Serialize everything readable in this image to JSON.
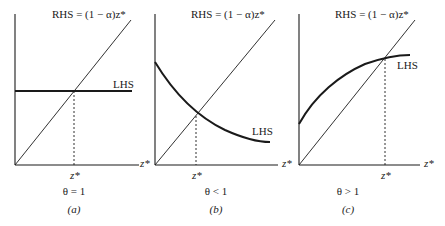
{
  "figure": {
    "panels": [
      {
        "id": "a",
        "caption": "(a)",
        "condition": "θ = 1",
        "rhs_label": "RHS = (1 − α)z*",
        "lhs_label": "LHS",
        "x_axis_label": "z*",
        "equilibrium_label": "z*",
        "lhs_shape": "horizontal"
      },
      {
        "id": "b",
        "caption": "(b)",
        "condition": "θ < 1",
        "rhs_label": "RHS = (1 − α)z*",
        "lhs_label": "LHS",
        "x_axis_label": "z*",
        "equilibrium_label": "z*",
        "lhs_shape": "decreasing convex"
      },
      {
        "id": "c",
        "caption": "(c)",
        "condition": "θ > 1",
        "rhs_label": "RHS = (1 − α)z*",
        "lhs_label": "LHS",
        "x_axis_label": "z*",
        "equilibrium_label": "z*",
        "lhs_shape": "increasing concave"
      }
    ],
    "colors": {
      "line": "#1a1a1a",
      "background": "#ffffff"
    }
  }
}
